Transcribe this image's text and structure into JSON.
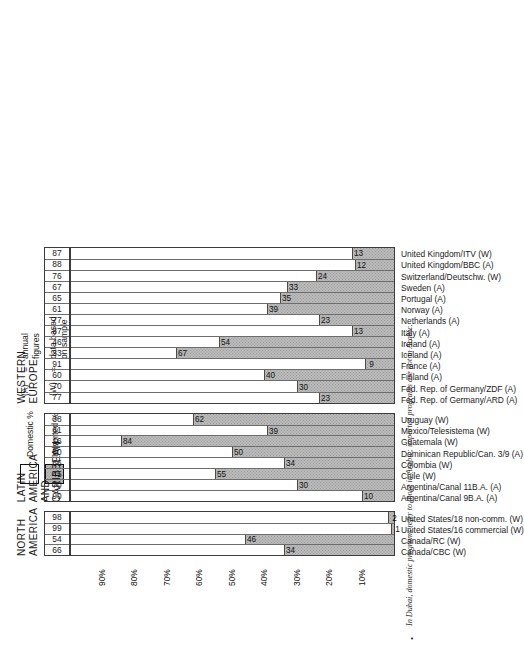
{
  "figure": {
    "footnote_bullet": "•",
    "footnote": "In Dubai, domestic programs refer to those in Arabic; imported programs are not in Arabic."
  },
  "legend": {
    "domestic_label": "Domestic %",
    "imported_label": "Imported %",
    "keys": [
      {
        "tag": "(A)",
        "eq": "=",
        "text": "annual\nfigures"
      },
      {
        "tag": "(W)",
        "eq": "=",
        "text": "data based\non sample\nweeks"
      }
    ]
  },
  "axis": {
    "ticks": [
      "10%",
      "20%",
      "30%",
      "40%",
      "50%",
      "60%",
      "70%",
      "80%",
      "90%"
    ],
    "tick_values": [
      10,
      20,
      30,
      40,
      50,
      60,
      70,
      80,
      90
    ],
    "max": 100
  },
  "colors": {
    "imported_fill": "#bcbcbc",
    "domestic_fill": "#ffffff",
    "grid": "#4b4b4b",
    "text": "#1a1a1a"
  },
  "groups": [
    {
      "title": "NORTH\nAMERICA",
      "items": [
        {
          "label": "Canada/CBC (W)",
          "imported": 34,
          "domestic": 66
        },
        {
          "label": "Canada/RC (W)",
          "imported": 46,
          "domestic": 54
        },
        {
          "label": "United States/16 commercial (W)",
          "imported": 1,
          "domestic": 99
        },
        {
          "label": "United States/18 non-comm. (W)",
          "imported": 2,
          "domestic": 98
        }
      ]
    },
    {
      "title": "LATIN AMERICA\nAND CARIBBEAN",
      "items": [
        {
          "label": "Argentina/Canal 9B.A. (A)",
          "imported": 10,
          "domestic": 90
        },
        {
          "label": "Argentina/Canal 11B.A. (A)",
          "imported": 30,
          "domestic": 70
        },
        {
          "label": "Chile (W)",
          "imported": 55,
          "domestic": 45
        },
        {
          "label": "Colombia (W)",
          "imported": 34,
          "domestic": 66
        },
        {
          "label": "Dominican Republic/Can. 3/9 (A)",
          "imported": 50,
          "domestic": 50
        },
        {
          "label": "Guatemala (W)",
          "imported": 84,
          "domestic": 16
        },
        {
          "label": "Mexico/Telesistema (W)",
          "imported": 39,
          "domestic": 61
        },
        {
          "label": "Uruguay (W)",
          "imported": 62,
          "domestic": 38
        }
      ]
    },
    {
      "title": "WESTERN EUROPE",
      "items": [
        {
          "label": "Fed. Rep. of Germany/ARD (A)",
          "imported": 23,
          "domestic": 77
        },
        {
          "label": "Fed. Rep. of Germany/ZDF (A)",
          "imported": 30,
          "domestic": 70
        },
        {
          "label": "Finland (A)",
          "imported": 40,
          "domestic": 60
        },
        {
          "label": "France (A)",
          "imported": 9,
          "domestic": 91
        },
        {
          "label": "Iceland (A)",
          "imported": 67,
          "domestic": 33
        },
        {
          "label": "Ireland (A)",
          "imported": 54,
          "domestic": 46
        },
        {
          "label": "Italy (A)",
          "imported": 13,
          "domestic": 87
        },
        {
          "label": "Netherlands (A)",
          "imported": 23,
          "domestic": 77
        },
        {
          "label": "Norway (A)",
          "imported": 39,
          "domestic": 61
        },
        {
          "label": "Portugal (A)",
          "imported": 35,
          "domestic": 65
        },
        {
          "label": "Sweden (A)",
          "imported": 33,
          "domestic": 67
        },
        {
          "label": "Switzerland/Deutschw. (W)",
          "imported": 24,
          "domestic": 76
        },
        {
          "label": "United Kingdom/BBC (A)",
          "imported": 12,
          "domestic": 88
        },
        {
          "label": "United Kingdom/ITV (W)",
          "imported": 13,
          "domestic": 87
        }
      ]
    }
  ],
  "chart_data": {
    "type": "bar",
    "title": "",
    "xlabel": "",
    "ylabel": "",
    "ylim": [
      0,
      100
    ],
    "grid": true,
    "legend_position": "top-left",
    "orientation": "vertical-bars-on-rotated-page",
    "categories": [
      "Canada/CBC (W)",
      "Canada/RC (W)",
      "United States/16 commercial (W)",
      "United States/18 non-comm. (W)",
      "Argentina/Canal 9B.A. (A)",
      "Argentina/Canal 11B.A. (A)",
      "Chile (W)",
      "Colombia (W)",
      "Dominican Republic/Can. 3/9 (A)",
      "Guatemala (W)",
      "Mexico/Telesistema (W)",
      "Uruguay (W)",
      "Fed. Rep. of Germany/ARD (A)",
      "Fed. Rep. of Germany/ZDF (A)",
      "Finland (A)",
      "France (A)",
      "Iceland (A)",
      "Ireland (A)",
      "Italy (A)",
      "Netherlands (A)",
      "Norway (A)",
      "Portugal (A)",
      "Sweden (A)",
      "Switzerland/Deutschw. (W)",
      "United Kingdom/BBC (A)",
      "United Kingdom/ITV (W)"
    ],
    "series": [
      {
        "name": "Imported %",
        "values": [
          34,
          46,
          1,
          2,
          10,
          30,
          55,
          34,
          50,
          84,
          39,
          62,
          23,
          30,
          40,
          9,
          67,
          54,
          13,
          23,
          39,
          35,
          33,
          24,
          12,
          13
        ]
      },
      {
        "name": "Domestic %",
        "values": [
          66,
          54,
          99,
          98,
          90,
          70,
          45,
          66,
          50,
          16,
          61,
          38,
          77,
          70,
          60,
          91,
          33,
          46,
          87,
          77,
          61,
          65,
          67,
          76,
          88,
          87
        ]
      }
    ],
    "group_labels": [
      "NORTH AMERICA",
      "LATIN AMERICA AND CARIBBEAN",
      "WESTERN EUROPE"
    ],
    "tick_labels": [
      "10%",
      "20%",
      "30%",
      "40%",
      "50%",
      "60%",
      "70%",
      "80%",
      "90%"
    ]
  }
}
